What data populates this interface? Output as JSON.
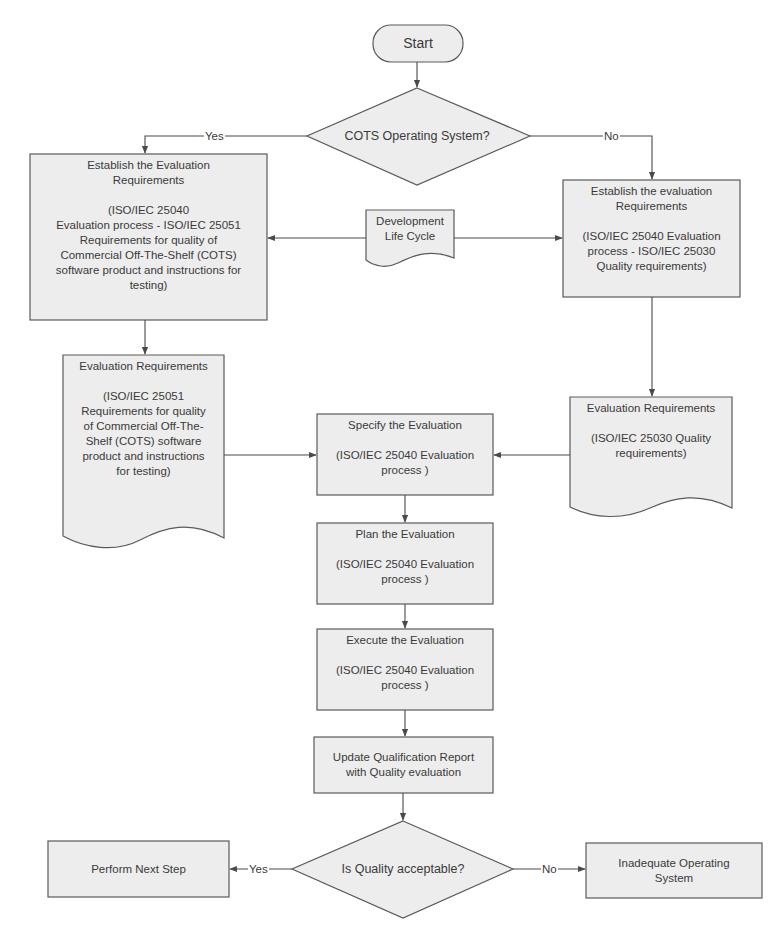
{
  "diagram": {
    "type": "flowchart",
    "colors": {
      "fill": "#ededed",
      "stroke": "#5a5a5a",
      "text": "#3a3a3a",
      "background": "#ffffff"
    },
    "start": {
      "label": "Start"
    },
    "decision1": {
      "label": "COTS Operating System?",
      "yes": "Yes",
      "no": "No"
    },
    "left_process": {
      "title": "Establish the Evaluation Requirements",
      "body": "(ISO/IEC 25040 Evaluation process - ISO/IEC 25051 Requirements for quality of Commercial Off-The-Shelf (COTS) software product and instructions for testing)",
      "lines": [
        "Establish the Evaluation",
        "Requirements",
        "",
        "(ISO/IEC 25040",
        "Evaluation process  - ISO/IEC 25051",
        "Requirements for quality of",
        "Commercial Off-The-Shelf (COTS)",
        "software product and instructions for",
        "testing)"
      ]
    },
    "dev_life_cycle": {
      "lines": [
        "Development",
        "Life Cycle"
      ]
    },
    "right_process": {
      "lines": [
        "Establish the evaluation",
        "Requirements",
        "",
        "(ISO/IEC 25040 Evaluation",
        "process - ISO/IEC 25030",
        "Quality requirements)"
      ]
    },
    "left_document": {
      "lines": [
        "Evaluation Requirements",
        "",
        "(ISO/IEC 25051",
        "Requirements for quality",
        "of Commercial Off-The-",
        "Shelf (COTS) software",
        "product and instructions",
        "for testing)"
      ]
    },
    "right_document": {
      "lines": [
        "Evaluation Requirements",
        "",
        "(ISO/IEC 25030 Quality",
        "requirements)"
      ]
    },
    "specify": {
      "lines": [
        "Specify the Evaluation",
        "",
        "(ISO/IEC 25040 Evaluation",
        "process )"
      ]
    },
    "plan": {
      "lines": [
        "Plan the Evaluation",
        "",
        "(ISO/IEC 25040 Evaluation",
        "process )"
      ]
    },
    "execute": {
      "lines": [
        "Execute the Evaluation",
        "",
        "(ISO/IEC 25040 Evaluation",
        "process )"
      ]
    },
    "update": {
      "lines": [
        "Update Qualification Report",
        "with Quality evaluation"
      ]
    },
    "decision2": {
      "label": "Is Quality acceptable?",
      "yes": "Yes",
      "no": "No"
    },
    "perform_next": {
      "label": "Perform Next Step"
    },
    "inadequate": {
      "lines": [
        "Inadequate Operating",
        "System"
      ]
    }
  }
}
